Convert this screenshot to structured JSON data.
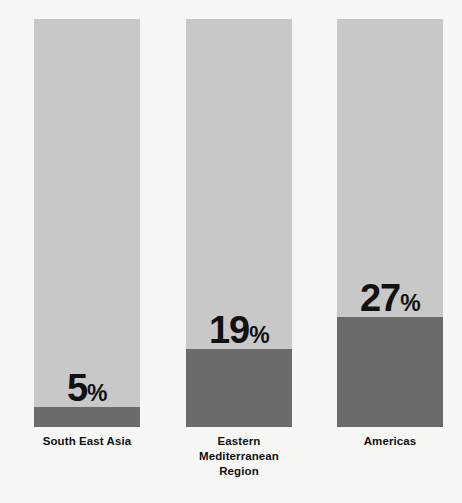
{
  "chart_data": {
    "type": "bar",
    "subtype": "stacked-percentage-column",
    "title": "",
    "subtitle": "",
    "xlabel": "",
    "ylabel": "",
    "ylim": [
      0,
      100
    ],
    "grid": false,
    "legend": "none",
    "units": "%",
    "categories": [
      "South East Asia",
      "Eastern Mediterranean Region",
      "Americas"
    ],
    "category_lines": [
      [
        "South East Asia"
      ],
      [
        "Eastern",
        "Mediterranean",
        "Region"
      ],
      [
        "Americas"
      ]
    ],
    "values": [
      5,
      19,
      27
    ],
    "value_labels": [
      "5",
      "19",
      "27"
    ],
    "percent_sign": "%",
    "remainder_values": [
      95,
      81,
      73
    ],
    "series": [
      {
        "name": "Highlighted share",
        "values": [
          5,
          19,
          27
        ],
        "color": "#6b6b6b"
      },
      {
        "name": "Remainder",
        "values": [
          95,
          81,
          73
        ],
        "color": "#c8c8c8"
      }
    ]
  },
  "colors": {
    "background": "#f7f7f5",
    "bar_light": "#c8c8c8",
    "bar_dark": "#6b6b6b",
    "text": "#111111"
  },
  "bars": [
    {
      "name": "south-east-asia",
      "value_number": "5",
      "percent_sign": "%",
      "label_lines": [
        "South East Asia"
      ],
      "fill_percent": 5,
      "left": 34,
      "width": 106
    },
    {
      "name": "eastern-mediterranean-region",
      "value_number": "19",
      "percent_sign": "%",
      "label_lines": [
        "Eastern",
        "Mediterranean",
        "Region"
      ],
      "fill_percent": 19,
      "left": 186,
      "width": 106
    },
    {
      "name": "americas",
      "value_number": "27",
      "percent_sign": "%",
      "label_lines": [
        "Americas"
      ],
      "fill_percent": 27,
      "left": 337,
      "width": 106
    }
  ]
}
